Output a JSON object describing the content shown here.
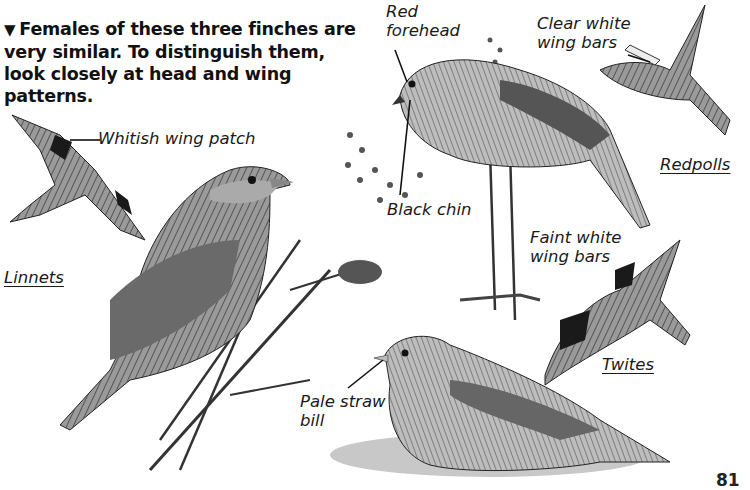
{
  "intro": {
    "marker": "▼",
    "text": "Females of these three finches are very similar. To distinguish them, look closely at head and wing patterns."
  },
  "species": {
    "linnets": "Linnets",
    "redpolls": "Redpolls",
    "twites": "Twites"
  },
  "labels": {
    "whitish_wing_patch": "Whitish wing patch",
    "red_forehead": "Red\nforehead",
    "clear_white_wing_bars": "Clear white\nwing bars",
    "black_chin": "Black chin",
    "faint_white_wing_bars": "Faint white\nwing bars",
    "pale_straw_bill": "Pale straw\nbill"
  },
  "illustrations": [
    {
      "name": "linnet-flying",
      "species": "Linnets"
    },
    {
      "name": "linnet-perched",
      "species": "Linnets"
    },
    {
      "name": "redpoll-perched",
      "species": "Redpolls"
    },
    {
      "name": "redpoll-flying",
      "species": "Redpolls"
    },
    {
      "name": "twite-flying",
      "species": "Twites"
    },
    {
      "name": "twite-ground",
      "species": "Twites"
    }
  ],
  "page_number": "81"
}
